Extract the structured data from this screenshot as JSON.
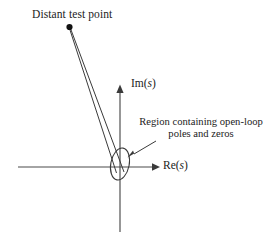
{
  "figure": {
    "type": "s-plane-root-locus-diagram",
    "background_color": "#ffffff",
    "line_color": "#3a3a3a",
    "text_color": "#1b1b1b",
    "width": 272,
    "height": 242
  },
  "labels": {
    "distant_test_point": "Distant test point",
    "im_axis_prefix": "Im(",
    "im_axis_var": "s",
    "im_axis_suffix": ")",
    "re_axis_prefix": "Re(",
    "re_axis_var": "s",
    "re_axis_suffix": ")",
    "region_line_1": "Region containing open-loop",
    "region_line_2": "poles and zeros"
  },
  "geometry": {
    "origin": {
      "x": 120,
      "y": 167
    },
    "real_axis": {
      "x_start": 18,
      "x_end": 158,
      "y": 167
    },
    "imag_axis": {
      "x": 120,
      "y_top": 85,
      "y_bottom": 232
    },
    "test_point": {
      "x": 69,
      "y": 27
    },
    "region_ellipse": {
      "cx": 120,
      "cy": 164,
      "rx": 9,
      "ry": 16,
      "rotation_deg": 11
    },
    "vector_1": {
      "x1": 69,
      "y1": 28,
      "x2": 117,
      "y2": 172
    },
    "vector_2": {
      "x1": 70,
      "y1": 28,
      "x2": 124,
      "y2": 172
    },
    "annotation_arrow": {
      "x1": 156,
      "y1": 142,
      "x2": 130,
      "y2": 156
    }
  }
}
